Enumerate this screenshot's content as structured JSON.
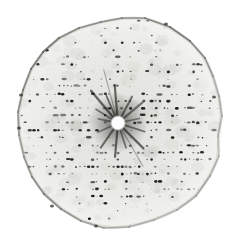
{
  "meta": {
    "width": 232,
    "height": 243
  },
  "photo": {
    "background_color": "#ffffff",
    "film_gradient": [
      "#d8d8d4",
      "#e2e2de",
      "#e7e7e3",
      "#eeeeeb",
      "#f4f4f1"
    ],
    "film_gradient_stops": [
      0,
      0.12,
      0.5,
      0.82,
      1
    ],
    "rim_color": "rgba(60,60,55,",
    "outer_rim_color": "rgba(150,150,145,0.25)",
    "spot_dark": 12,
    "spot_light": 122,
    "center": {
      "x": 118,
      "y": 123
    },
    "beam_hole_radius": 5.6,
    "halo_radius": 30,
    "row_spacing": 7.3,
    "spot_pitch": 4.2,
    "seed": 9,
    "outline": [
      [
        145,
        18,
        0.55
      ],
      [
        170,
        27,
        0.6
      ],
      [
        190,
        41,
        0.55
      ],
      [
        205,
        58,
        0.45
      ],
      [
        213,
        76,
        0.3
      ],
      [
        219,
        96,
        0.3
      ],
      [
        222,
        116,
        0.25
      ],
      [
        218,
        136,
        0.2
      ],
      [
        219,
        156,
        0.3
      ],
      [
        210,
        176,
        0.35
      ],
      [
        196,
        196,
        0.3
      ],
      [
        177,
        210,
        0.25
      ],
      [
        154,
        220,
        0.3
      ],
      [
        129,
        227,
        0.35
      ],
      [
        104,
        228,
        0.4
      ],
      [
        81,
        221,
        0.45
      ],
      [
        61,
        209,
        0.5
      ],
      [
        44,
        194,
        0.5
      ],
      [
        32,
        177,
        0.45
      ],
      [
        24,
        157,
        0.4
      ],
      [
        19,
        135,
        0.45
      ],
      [
        18,
        112,
        0.5
      ],
      [
        23,
        90,
        0.55
      ],
      [
        31,
        69,
        0.6
      ],
      [
        43,
        52,
        0.6
      ],
      [
        59,
        38,
        0.55
      ],
      [
        79,
        28,
        0.5
      ],
      [
        101,
        22,
        0.5
      ],
      [
        122,
        18,
        0.5
      ]
    ],
    "rim_marks": [
      [
        21,
        95
      ],
      [
        19,
        128
      ],
      [
        214,
        97
      ],
      [
        166,
        24
      ],
      [
        52,
        206
      ],
      [
        96,
        226
      ]
    ],
    "streaks": [
      {
        "a": 95,
        "len": 38,
        "w": 2.2,
        "al": 0.6
      },
      {
        "a": 113,
        "len": 30,
        "w": 1.8,
        "al": 0.55
      },
      {
        "a": 130,
        "len": 42,
        "w": 2.4,
        "al": 0.6
      },
      {
        "a": 148,
        "len": 26,
        "w": 1.6,
        "al": 0.5
      },
      {
        "a": 168,
        "len": 20,
        "w": 1.8,
        "al": 0.45
      },
      {
        "a": 62,
        "len": 30,
        "w": 2.0,
        "al": 0.55
      },
      {
        "a": 40,
        "len": 34,
        "w": 2.2,
        "al": 0.5
      },
      {
        "a": 12,
        "len": 22,
        "w": 1.6,
        "al": 0.45
      },
      {
        "a": -18,
        "len": 28,
        "w": 1.8,
        "al": 0.5
      },
      {
        "a": -45,
        "len": 36,
        "w": 2.4,
        "al": 0.6
      },
      {
        "a": -72,
        "len": 26,
        "w": 1.8,
        "al": 0.5
      },
      {
        "a": -95,
        "len": 34,
        "w": 2.2,
        "al": 0.6
      },
      {
        "a": -125,
        "len": 30,
        "w": 2.0,
        "al": 0.55
      },
      {
        "a": -155,
        "len": 22,
        "w": 1.6,
        "al": 0.45
      },
      {
        "a": 105,
        "len": 55,
        "w": 1.2,
        "al": 0.3
      },
      {
        "a": -60,
        "len": 50,
        "w": 1.2,
        "al": 0.3
      }
    ]
  }
}
